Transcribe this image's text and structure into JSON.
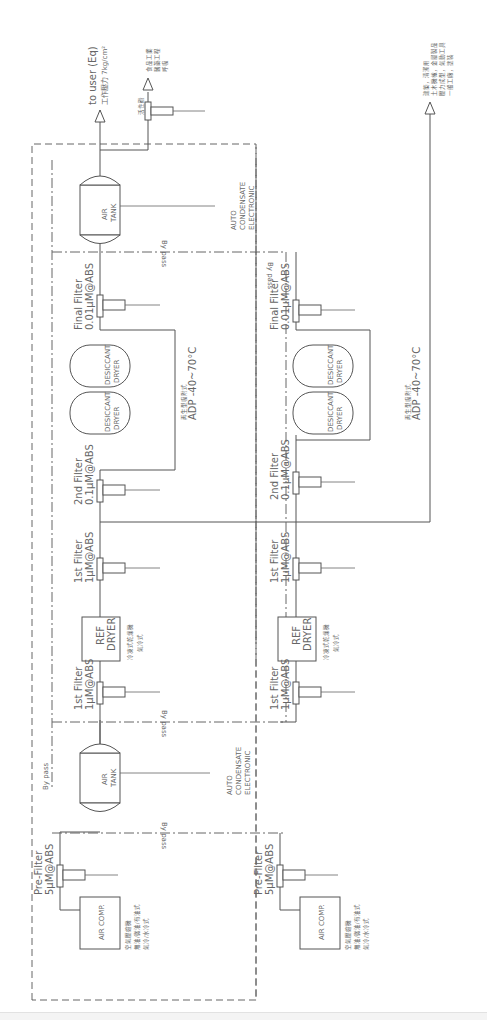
{
  "diagram": {
    "orientation": "rotated 90deg counter-clockwise",
    "outlets": {
      "to_user": "to user (Eq)",
      "pressure": "工作壓力 7kg/cm²",
      "food_branch": {
        "unit": "活性碳",
        "lines": [
          "食品工業",
          "醫藥工程",
          "呼吸"
        ]
      },
      "general_branch": {
        "lines": [
          "建築，清潔用",
          "土木機械，金屬製品",
          "壓力成型，氣動工具",
          "一般工廠，塗裝"
        ]
      }
    },
    "train_a": {
      "air_comp": "AIR COMP.",
      "air_comp_notes": [
        "空氣壓縮機",
        "無油/微油/有油式",
        "氣冷/水冷式"
      ],
      "pre_filter": [
        "Pre-Filter",
        "5µM@ABS"
      ],
      "bypass1": "By pass",
      "air_tank1": [
        "AIR",
        "TANK"
      ],
      "tank1_drain": [
        "AUTO",
        "CONDENSATE",
        "ELECTRONIC"
      ],
      "bypass_tank": "By pass",
      "filter1a": [
        "1st  Filter",
        "1µM@ABS"
      ],
      "ref_dryer": [
        "REF",
        "DRYER"
      ],
      "ref_notes": [
        "冷凍式乾燥機",
        "氣冷式"
      ],
      "filter1b": [
        "1st  Filter",
        "1µM@ABS"
      ],
      "filter2": [
        "2nd  Filter",
        "0.1µM@ABS"
      ],
      "desiccant1": [
        "DESICCANT",
        "DRYER"
      ],
      "desiccant2": [
        "DESICCANT",
        "DRYER"
      ],
      "desiccant_notes": [
        "再生型吸附式",
        "ADP  -40~70°C"
      ],
      "final_filter": [
        "Final  Filter",
        "0.01µM@ABS"
      ],
      "bypass2": "By pass",
      "air_tank2": [
        "AIR",
        "TANK"
      ],
      "tank2_drain": [
        "AUTO",
        "CONDENSATE",
        "ELECTRONIC"
      ]
    },
    "train_b": {
      "air_comp": "AIR COMP.",
      "air_comp_notes": [
        "空氣壓縮機",
        "無油/微油/有油式",
        "氣冷/水冷式"
      ],
      "pre_filter": [
        "Pre-Filter",
        "5µM@ABS"
      ],
      "bypass1": "By pass",
      "filter1a": [
        "1st  Filter",
        "1µM@ABS"
      ],
      "ref_dryer": [
        "REF",
        "DRYER"
      ],
      "ref_notes": [
        "冷凍式乾燥機",
        "氣冷式"
      ],
      "filter1b": [
        "1st  Filter",
        "1µM@ABS"
      ],
      "filter2": [
        "2nd  Filter",
        "0.1µM@ABS"
      ],
      "desiccant1": [
        "DESICCANT",
        "DRYER"
      ],
      "desiccant2": [
        "DESICCANT",
        "DRYER"
      ],
      "desiccant_notes": [
        "再生型吸附式",
        "ADP  -40~70°C"
      ],
      "final_filter": [
        "Final  Filter",
        "0.01µM@ABS"
      ],
      "bypass2": "By pass"
    }
  }
}
